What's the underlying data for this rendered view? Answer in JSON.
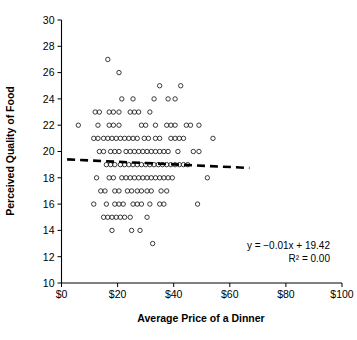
{
  "chart_data": {
    "type": "scatter",
    "title": "",
    "xlabel": "Average Price of a Dinner",
    "ylabel": "Perceived Quality of Food",
    "xlim": [
      0,
      100
    ],
    "ylim": [
      10,
      30
    ],
    "xticks": [
      0,
      20,
      40,
      60,
      80,
      100
    ],
    "xtick_labels": [
      "$0",
      "$20",
      "$40",
      "$60",
      "$80",
      "$100"
    ],
    "yticks": [
      10,
      12,
      14,
      16,
      18,
      20,
      22,
      24,
      26,
      28,
      30
    ],
    "ytick_labels": [
      "10",
      "12",
      "14",
      "16",
      "18",
      "20",
      "22",
      "24",
      "26",
      "28",
      "30"
    ],
    "grid": false,
    "legend": "none",
    "marker": "open-circle",
    "annotations": [
      {
        "name": "regression-equation",
        "text": "y = −0.01x + 19.42"
      },
      {
        "name": "r-squared",
        "text": "R² = 0.00"
      }
    ],
    "trendline": {
      "type": "linear",
      "slope": -0.01,
      "intercept": 19.42,
      "r_squared": 0.0,
      "style": "dashed",
      "x_start": 2,
      "x_end": 67,
      "y_start": 19.4,
      "y_end": 18.75
    },
    "points": [
      [
        16.5,
        27.0
      ],
      [
        20.5,
        26.0
      ],
      [
        35.0,
        25.0
      ],
      [
        42.5,
        25.0
      ],
      [
        21.5,
        24.0
      ],
      [
        25.5,
        24.0
      ],
      [
        33.0,
        24.0
      ],
      [
        38.0,
        24.0
      ],
      [
        40.5,
        24.0
      ],
      [
        12.0,
        23.0
      ],
      [
        13.5,
        23.0
      ],
      [
        17.0,
        23.0
      ],
      [
        18.5,
        23.0
      ],
      [
        20.5,
        23.0
      ],
      [
        24.5,
        23.0
      ],
      [
        26.0,
        23.0
      ],
      [
        27.5,
        23.0
      ],
      [
        31.5,
        23.0
      ],
      [
        6.0,
        22.0
      ],
      [
        13.0,
        22.0
      ],
      [
        17.0,
        22.0
      ],
      [
        18.5,
        22.0
      ],
      [
        20.5,
        22.0
      ],
      [
        28.5,
        22.0
      ],
      [
        30.0,
        22.0
      ],
      [
        33.5,
        22.0
      ],
      [
        37.5,
        22.0
      ],
      [
        39.0,
        22.0
      ],
      [
        40.5,
        22.0
      ],
      [
        44.5,
        22.0
      ],
      [
        46.0,
        22.0
      ],
      [
        49.0,
        22.0
      ],
      [
        11.5,
        21.0
      ],
      [
        13.0,
        21.0
      ],
      [
        15.0,
        21.0
      ],
      [
        16.5,
        21.0
      ],
      [
        18.0,
        21.0
      ],
      [
        19.5,
        21.0
      ],
      [
        21.0,
        21.0
      ],
      [
        22.5,
        21.0
      ],
      [
        24.0,
        21.0
      ],
      [
        25.5,
        21.0
      ],
      [
        27.0,
        21.0
      ],
      [
        29.5,
        21.0
      ],
      [
        31.0,
        21.0
      ],
      [
        33.5,
        21.0
      ],
      [
        35.0,
        21.0
      ],
      [
        39.0,
        21.0
      ],
      [
        40.5,
        21.0
      ],
      [
        42.0,
        21.0
      ],
      [
        43.5,
        21.0
      ],
      [
        54.0,
        21.0
      ],
      [
        13.5,
        20.0
      ],
      [
        15.0,
        20.0
      ],
      [
        17.5,
        20.0
      ],
      [
        19.0,
        20.0
      ],
      [
        20.5,
        20.0
      ],
      [
        23.0,
        20.0
      ],
      [
        24.5,
        20.0
      ],
      [
        26.0,
        20.0
      ],
      [
        27.5,
        20.0
      ],
      [
        29.0,
        20.0
      ],
      [
        30.5,
        20.0
      ],
      [
        32.0,
        20.0
      ],
      [
        33.5,
        20.0
      ],
      [
        35.0,
        20.0
      ],
      [
        36.5,
        20.0
      ],
      [
        38.0,
        20.0
      ],
      [
        41.5,
        20.0
      ],
      [
        47.0,
        20.0
      ],
      [
        49.0,
        20.0
      ],
      [
        16.0,
        19.0
      ],
      [
        17.5,
        19.0
      ],
      [
        19.0,
        19.0
      ],
      [
        21.0,
        19.0
      ],
      [
        22.5,
        19.0
      ],
      [
        24.0,
        19.0
      ],
      [
        25.5,
        19.0
      ],
      [
        27.0,
        19.0
      ],
      [
        28.5,
        19.0
      ],
      [
        30.0,
        19.0
      ],
      [
        31.5,
        19.0
      ],
      [
        33.0,
        19.0
      ],
      [
        34.5,
        19.0
      ],
      [
        36.0,
        19.0
      ],
      [
        37.5,
        19.0
      ],
      [
        39.0,
        19.0
      ],
      [
        40.5,
        19.0
      ],
      [
        42.0,
        19.0
      ],
      [
        43.5,
        19.0
      ],
      [
        45.0,
        19.0
      ],
      [
        12.5,
        18.0
      ],
      [
        17.0,
        18.0
      ],
      [
        18.5,
        18.0
      ],
      [
        21.5,
        18.0
      ],
      [
        23.0,
        18.0
      ],
      [
        24.5,
        18.0
      ],
      [
        26.0,
        18.0
      ],
      [
        27.5,
        18.0
      ],
      [
        29.0,
        18.0
      ],
      [
        30.5,
        18.0
      ],
      [
        32.0,
        18.0
      ],
      [
        33.5,
        18.0
      ],
      [
        35.0,
        18.0
      ],
      [
        36.5,
        18.0
      ],
      [
        38.0,
        18.0
      ],
      [
        39.5,
        18.0
      ],
      [
        52.0,
        18.0
      ],
      [
        14.0,
        17.0
      ],
      [
        15.5,
        17.0
      ],
      [
        19.0,
        17.0
      ],
      [
        20.5,
        17.0
      ],
      [
        23.5,
        17.0
      ],
      [
        25.0,
        17.0
      ],
      [
        27.0,
        17.0
      ],
      [
        28.5,
        17.0
      ],
      [
        30.5,
        17.0
      ],
      [
        32.0,
        17.0
      ],
      [
        35.5,
        17.0
      ],
      [
        37.5,
        17.0
      ],
      [
        11.5,
        16.0
      ],
      [
        16.0,
        16.0
      ],
      [
        19.0,
        16.0
      ],
      [
        20.5,
        16.0
      ],
      [
        22.0,
        16.0
      ],
      [
        25.5,
        16.0
      ],
      [
        27.0,
        16.0
      ],
      [
        28.5,
        16.0
      ],
      [
        31.5,
        16.0
      ],
      [
        35.0,
        16.0
      ],
      [
        36.5,
        16.0
      ],
      [
        48.5,
        16.0
      ],
      [
        15.0,
        15.0
      ],
      [
        16.5,
        15.0
      ],
      [
        18.0,
        15.0
      ],
      [
        19.5,
        15.0
      ],
      [
        21.0,
        15.0
      ],
      [
        22.5,
        15.0
      ],
      [
        24.5,
        15.0
      ],
      [
        30.5,
        15.0
      ],
      [
        18.0,
        14.0
      ],
      [
        25.0,
        14.0
      ],
      [
        28.0,
        14.0
      ],
      [
        32.5,
        13.0
      ]
    ]
  },
  "axes": {
    "x_title": "Average Price of a Dinner",
    "y_title": "Perceived Quality of Food"
  },
  "annotation_block": {
    "line1": "y = −0.01x + 19.42",
    "line2": "R² = 0.00"
  },
  "colors": {
    "axis": "#000000",
    "marker_stroke": "#1a1a1a",
    "trendline": "#000000",
    "background": "#ffffff"
  }
}
